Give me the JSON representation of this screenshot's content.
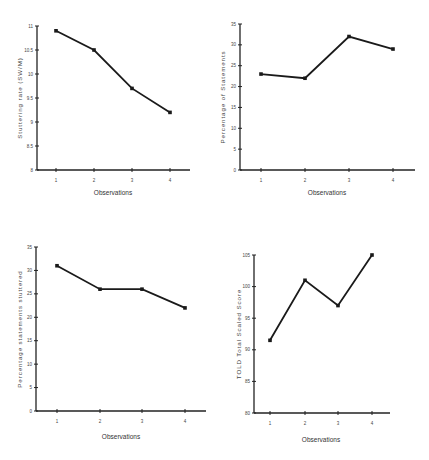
{
  "chart_data": [
    {
      "type": "line",
      "title": "",
      "xlabel": "Observations",
      "ylabel": "Stuttering rate (SW/M)",
      "categories": [
        "1",
        "2",
        "3",
        "4"
      ],
      "values": [
        10.9,
        10.5,
        9.7,
        9.2
      ],
      "ylim": [
        8,
        11
      ],
      "yticks": [
        8,
        8.5,
        9,
        9.5,
        10,
        10.5,
        11
      ],
      "ytick_labels": [
        "8",
        "8.5",
        "9",
        "9.5",
        "10",
        "10.5",
        "11"
      ],
      "grid": false,
      "legend": null
    },
    {
      "type": "line",
      "title": "",
      "xlabel": "Observations",
      "ylabel": "Percentage of Statements",
      "categories": [
        "1",
        "2",
        "3",
        "4"
      ],
      "values": [
        23,
        22,
        32,
        29
      ],
      "ylim": [
        0,
        35
      ],
      "yticks": [
        0,
        5,
        10,
        15,
        20,
        25,
        30,
        35
      ],
      "ytick_labels": [
        "0",
        "5",
        "10",
        "15",
        "20",
        "25",
        "30",
        "35"
      ],
      "grid": false,
      "legend": null
    },
    {
      "type": "line",
      "title": "",
      "xlabel": "Observations",
      "ylabel": "Percentage statements stuttered",
      "categories": [
        "1",
        "2",
        "3",
        "4"
      ],
      "values": [
        31,
        26,
        26,
        22
      ],
      "ylim": [
        0,
        35
      ],
      "yticks": [
        0,
        5,
        10,
        15,
        20,
        25,
        30,
        35
      ],
      "ytick_labels": [
        "0",
        "5",
        "10",
        "15",
        "20",
        "25",
        "30",
        "35"
      ],
      "grid": false,
      "legend": null
    },
    {
      "type": "line",
      "title": "",
      "xlabel": "Observations",
      "ylabel": "TOLD Total Scaled Score",
      "categories": [
        "1",
        "2",
        "3",
        "4"
      ],
      "values": [
        91.5,
        101,
        97,
        105
      ],
      "ylim": [
        80,
        105
      ],
      "yticks": [
        80,
        85,
        90,
        95,
        100,
        105
      ],
      "ytick_labels": [
        "80",
        "85",
        "90",
        "95",
        "100",
        "105"
      ],
      "grid": false,
      "legend": null
    }
  ],
  "panels": [
    {
      "xlabel": "Observations",
      "ylabel": "Stuttering rate (SW/M)"
    },
    {
      "xlabel": "Observations",
      "ylabel": "Percentage of Statements"
    },
    {
      "xlabel": "Observations",
      "ylabel": "Percentage statements stuttered"
    },
    {
      "xlabel": "Observations",
      "ylabel": "TOLD Total Scaled Score"
    }
  ]
}
